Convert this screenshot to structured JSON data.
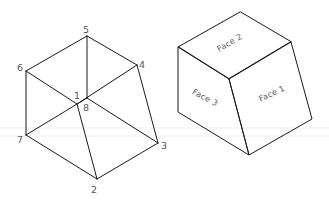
{
  "diagram": {
    "left_cube": {
      "title": "numbered-vertex cube",
      "vertices": {
        "1": {
          "label": "1",
          "x": 77,
          "y": 104
        },
        "2": {
          "label": "2",
          "x": 97,
          "y": 179
        },
        "3": {
          "label": "3",
          "x": 158,
          "y": 143
        },
        "4": {
          "label": "4",
          "x": 137,
          "y": 65
        },
        "5": {
          "label": "5",
          "x": 87,
          "y": 36
        },
        "6": {
          "label": "6",
          "x": 26,
          "y": 71
        },
        "7": {
          "label": "7",
          "x": 26,
          "y": 135
        },
        "8": {
          "label": "8",
          "x": 87,
          "y": 98
        }
      },
      "edges": [
        [
          "5",
          "6"
        ],
        [
          "5",
          "4"
        ],
        [
          "5",
          "8"
        ],
        [
          "6",
          "7"
        ],
        [
          "6",
          "1"
        ],
        [
          "4",
          "3"
        ],
        [
          "4",
          "1"
        ],
        [
          "7",
          "2"
        ],
        [
          "7",
          "8"
        ],
        [
          "3",
          "2"
        ],
        [
          "3",
          "8"
        ],
        [
          "1",
          "2"
        ]
      ],
      "labels": [
        "1",
        "2",
        "3",
        "4",
        "5",
        "6",
        "7",
        "8"
      ]
    },
    "right_cube": {
      "title": "face-labeled cube",
      "faces": {
        "face1": "Face 1",
        "face2": "Face 2",
        "face3": "Face 3"
      }
    },
    "line_color": "#1a1a1a",
    "label_color": "#555555"
  }
}
